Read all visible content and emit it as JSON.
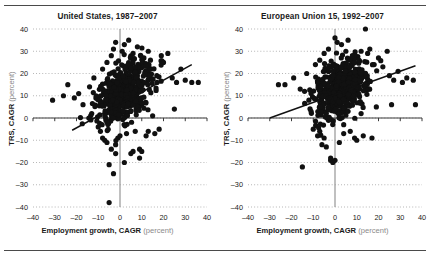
{
  "figure": {
    "background": "#ffffff",
    "rules": {
      "top_color": "#4a4a4a",
      "bottom_color": "#4a4a4a"
    }
  },
  "chart_data": [
    {
      "type": "scatter",
      "panel": "left",
      "title": "United States, 1987–2007",
      "xlabel": "Employment growth, CAGR",
      "xlabel_unit": "(percent)",
      "ylabel": "TRS, CAGR",
      "ylabel_unit": "(percent)",
      "xlim": [
        -40,
        40
      ],
      "ylim": [
        -40,
        40
      ],
      "xticks": [
        -40,
        -30,
        -20,
        -10,
        0,
        10,
        20,
        30,
        40
      ],
      "yticks": [
        40,
        30,
        20,
        10,
        0,
        -10,
        -20,
        -30,
        -40
      ],
      "xticklabels": [
        "–40",
        "–30",
        "–20",
        "–10",
        "0",
        "10",
        "20",
        "30",
        "40"
      ],
      "yticklabels": [
        "40",
        "30",
        "20",
        "10",
        "0",
        "–10",
        "–20",
        "–30",
        "–40"
      ],
      "grid": "horizontal-dotted",
      "grid_color": "#9a9a9a",
      "zero_line_x": 0,
      "zero_line_y": 0,
      "zero_line_color": "#8c8c8c",
      "axis_color": "#3a3a3a",
      "marker_color": "#111111",
      "marker_size": 2.6,
      "trend": {
        "x0": -22,
        "y0": -5.5,
        "x1": 33,
        "y1": 24.0,
        "color": "#111111",
        "width": 1.5
      },
      "n_points": 520,
      "cluster": {
        "x_mean": 2.0,
        "x_sd": 6.2,
        "y_mean": 11.0,
        "y_sd": 6.6,
        "corr": 0.45
      },
      "outliers": [
        [
          -31,
          8
        ],
        [
          -26,
          10
        ],
        [
          -24,
          15
        ],
        [
          -21,
          9
        ],
        [
          -19,
          11
        ],
        [
          -17,
          6
        ],
        [
          -14,
          14
        ],
        [
          -13,
          2
        ],
        [
          -12,
          18
        ],
        [
          -11,
          10
        ],
        [
          -10,
          -4
        ],
        [
          -9,
          -6
        ],
        [
          -8,
          -9
        ],
        [
          -8,
          22
        ],
        [
          -7,
          -10
        ],
        [
          -6,
          -11
        ],
        [
          -6,
          25
        ],
        [
          -5,
          -38
        ],
        [
          -5,
          -21
        ],
        [
          -4,
          -14
        ],
        [
          -4,
          28
        ],
        [
          -3,
          -25
        ],
        [
          -3,
          31
        ],
        [
          -2,
          -12
        ],
        [
          -2,
          34
        ],
        [
          -1,
          -9
        ],
        [
          0,
          -8
        ],
        [
          1,
          30
        ],
        [
          2,
          33
        ],
        [
          3,
          -7
        ],
        [
          4,
          35
        ],
        [
          5,
          -16
        ],
        [
          6,
          29
        ],
        [
          7,
          -6
        ],
        [
          8,
          32
        ],
        [
          9,
          -14
        ],
        [
          10,
          -15
        ],
        [
          11,
          27
        ],
        [
          12,
          -8
        ],
        [
          13,
          30
        ],
        [
          14,
          26
        ],
        [
          16,
          -7
        ],
        [
          17,
          16
        ],
        [
          19,
          28
        ],
        [
          20,
          25
        ],
        [
          22,
          29
        ],
        [
          24,
          18
        ],
        [
          26,
          16
        ],
        [
          28,
          22
        ],
        [
          30,
          17
        ],
        [
          33,
          16
        ],
        [
          36,
          16
        ],
        [
          25,
          4
        ],
        [
          15,
          1
        ],
        [
          13,
          -6
        ],
        [
          18,
          -5
        ],
        [
          9,
          -18
        ],
        [
          -2,
          -16
        ],
        [
          6,
          -15
        ],
        [
          2,
          -20
        ]
      ]
    },
    {
      "type": "scatter",
      "panel": "right",
      "title": "European Union 15, 1992–2007",
      "xlabel": "Employment growth, CAGR",
      "xlabel_unit": "(percent)",
      "ylabel": "TRS, CAGR",
      "ylabel_unit": "(percent)",
      "xlim": [
        -40,
        40
      ],
      "ylim": [
        -40,
        40
      ],
      "xticks": [
        -40,
        -30,
        -20,
        -10,
        0,
        10,
        20,
        30,
        40
      ],
      "yticks": [
        40,
        30,
        20,
        10,
        0,
        -10,
        -20,
        -30,
        -40
      ],
      "xticklabels": [
        "–40",
        "–30",
        "–20",
        "–10",
        "0",
        "10",
        "20",
        "30",
        "40"
      ],
      "yticklabels": [
        "40",
        "30",
        "20",
        "10",
        "0",
        "–10",
        "–20",
        "–30",
        "–40"
      ],
      "grid": "horizontal-dotted",
      "grid_color": "#9a9a9a",
      "zero_line_x": 0,
      "zero_line_y": 0,
      "zero_line_color": "#8c8c8c",
      "axis_color": "#3a3a3a",
      "marker_color": "#111111",
      "marker_size": 2.6,
      "trend": {
        "x0": -30,
        "y0": 0.0,
        "x1": 37,
        "y1": 23.5,
        "color": "#111111",
        "width": 1.5
      },
      "n_points": 520,
      "cluster": {
        "x_mean": 2.5,
        "x_sd": 6.0,
        "y_mean": 13.0,
        "y_sd": 6.3,
        "corr": 0.38
      },
      "outliers": [
        [
          -26,
          15
        ],
        [
          -23,
          15
        ],
        [
          -19,
          18
        ],
        [
          -16,
          13
        ],
        [
          -15,
          -22
        ],
        [
          -14,
          12
        ],
        [
          -13,
          20
        ],
        [
          -12,
          8
        ],
        [
          -11,
          3
        ],
        [
          -10,
          -5
        ],
        [
          -9,
          24
        ],
        [
          -8,
          -8
        ],
        [
          -7,
          -6
        ],
        [
          -7,
          26
        ],
        [
          -6,
          -12
        ],
        [
          -5,
          -9
        ],
        [
          -5,
          29
        ],
        [
          -4,
          -13
        ],
        [
          -3,
          31
        ],
        [
          -2,
          -18
        ],
        [
          -2,
          -19
        ],
        [
          -1,
          -20
        ],
        [
          0,
          -19
        ],
        [
          0,
          36
        ],
        [
          1,
          34
        ],
        [
          2,
          -11
        ],
        [
          3,
          33
        ],
        [
          4,
          -7
        ],
        [
          5,
          30
        ],
        [
          6,
          35
        ],
        [
          7,
          -6
        ],
        [
          8,
          28
        ],
        [
          9,
          -9
        ],
        [
          10,
          -10
        ],
        [
          11,
          26
        ],
        [
          12,
          30
        ],
        [
          13,
          -8
        ],
        [
          14,
          40
        ],
        [
          15,
          29
        ],
        [
          16,
          31
        ],
        [
          17,
          -9
        ],
        [
          18,
          24
        ],
        [
          20,
          27
        ],
        [
          22,
          23
        ],
        [
          24,
          30
        ],
        [
          25,
          19
        ],
        [
          27,
          17
        ],
        [
          29,
          21
        ],
        [
          31,
          16
        ],
        [
          33,
          18
        ],
        [
          36,
          17
        ],
        [
          37,
          6
        ],
        [
          26,
          6
        ],
        [
          19,
          5
        ],
        [
          12,
          2
        ],
        [
          6,
          3
        ],
        [
          -8,
          16
        ],
        [
          -11,
          11
        ],
        [
          4,
          -3
        ],
        [
          -4,
          2
        ]
      ]
    }
  ]
}
